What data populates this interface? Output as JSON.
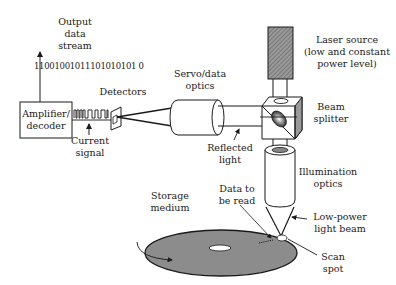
{
  "diagram": {
    "labels": {
      "output_stream": "Output\ndata\nstream",
      "bit_stream": "11001001011101010101 0",
      "amplifier": "Amplifier/\ndecoder",
      "detectors": "Detectors",
      "current_signal": "Current\nsignal",
      "servo_optics": "Servo/data\noptics",
      "laser_source": "Laser source\n(low and constant\npower level)",
      "beam_splitter": "Beam\nsplitter",
      "reflected_light": "Reflected\nlight",
      "illumination_optics": "Illumination\noptics",
      "data_to_be_read": "Data to\nbe read",
      "low_power_beam": "Low-power\nlight beam",
      "storage_medium": "Storage\nmedium",
      "scan_spot": "Scan\nspot"
    },
    "colors": {
      "line": "#1a1a1a",
      "disk_fill": "#8c8c8c",
      "laser_fill": "#7a7a7a",
      "prism_shade": "#9a9a9a"
    }
  }
}
